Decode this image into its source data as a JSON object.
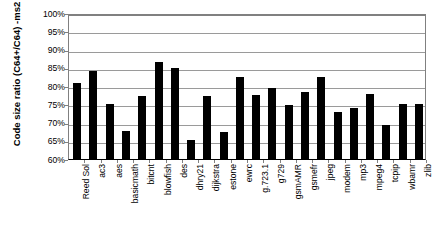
{
  "chart_data": {
    "type": "bar",
    "title": "",
    "subtitle": "",
    "xlabel": "",
    "ylabel": "Code size ratio (C64+/C64) -ms2",
    "ylim": [
      60,
      100
    ],
    "ytick_step": 5,
    "ytick_labels": [
      "100%",
      "95%",
      "90%",
      "85%",
      "80%",
      "75%",
      "70%",
      "65%",
      "60%"
    ],
    "ytick_values": [
      100,
      95,
      90,
      85,
      80,
      75,
      70,
      65,
      60
    ],
    "grid": true,
    "legend": null,
    "legend_position": "none",
    "bar_color": "#000000",
    "gridline_color": "#9a9a9a",
    "axis_color": "#808080",
    "background_color": "#ffffff",
    "categories": [
      "Reed Sol",
      "ac3",
      "aes",
      "basicmath",
      "bitcnt",
      "blowfish",
      "des",
      "dhry21",
      "dijkstra",
      "estone",
      "ewrc",
      "g.723.1",
      "g729",
      "gsmAMR",
      "gsmefr",
      "jpeg",
      "modem",
      "mp3",
      "mpeg4",
      "tcpip",
      "wbamr",
      "zlib"
    ],
    "values": [
      80.7,
      84.0,
      75.2,
      67.7,
      77.4,
      86.6,
      84.8,
      65.2,
      77.2,
      67.3,
      82.5,
      77.6,
      79.5,
      74.9,
      78.3,
      82.5,
      73.0,
      74.0,
      77.8,
      69.3,
      75.2,
      75.2
    ],
    "units": "%"
  }
}
